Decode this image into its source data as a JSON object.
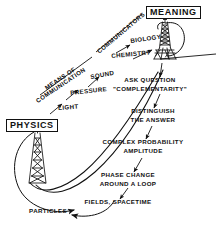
{
  "diagram": {
    "ink_color": "#111111",
    "background_color": "#ffffff",
    "width": 221,
    "height": 226
  },
  "nodes": {
    "meaning": {
      "label": "MEANING"
    },
    "physics": {
      "label": "PHYSICS"
    }
  },
  "towers": {
    "meaning_tower": {
      "name": "lattice-tower"
    },
    "physics_tower": {
      "name": "lattice-tower"
    }
  },
  "left_branch": {
    "heading": "MEANS OF",
    "heading2": "COMMUNICATION",
    "items": [
      {
        "label": "SOUND"
      },
      {
        "label": "PRESSURE"
      },
      {
        "label": "LIGHT"
      }
    ]
  },
  "upper_branch": {
    "heading": "COMMUNICATORS",
    "items": [
      {
        "label": "BIOLOGY"
      },
      {
        "label": "CHEMISTRY"
      }
    ]
  },
  "right_chain": {
    "steps": [
      {
        "line1": "ASK QUESTION",
        "line2": "\"COMPLEMENTARITY\""
      },
      {
        "line1": "DISTINGUISH",
        "line2": "THE ANSWER"
      },
      {
        "line1": "COMPLEX PROBABILITY",
        "line2": "AMPLITUDE"
      },
      {
        "line1": "PHASE CHANGE",
        "line2": "AROUND A LOOP"
      },
      {
        "line1": "FIELDS, SPACETIME",
        "line2": ""
      },
      {
        "line1": "PARTICLES",
        "line2": ""
      }
    ]
  }
}
